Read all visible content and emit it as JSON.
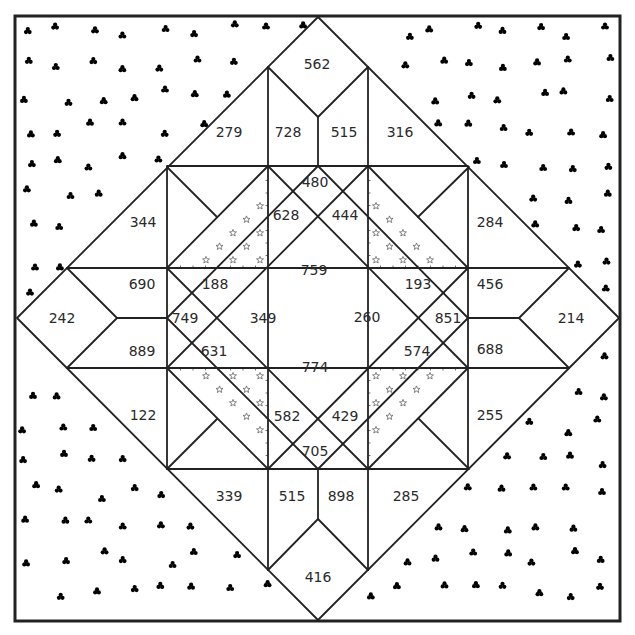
{
  "colors": {
    "line": "#222222",
    "text": "#2a2a2a",
    "clover": "#555555",
    "star": "#666666",
    "background": "#ffffff"
  },
  "patterns": {
    "background_corners": "clover-icon",
    "inner_corner_triangles": "star-icon"
  },
  "patches": {
    "top_apex": "562",
    "top_left_of_v": "728",
    "top_right_of_v": "515",
    "top_left_outer": "279",
    "top_right_outer": "316",
    "upper_left_outer": "344",
    "upper_right_outer": "284",
    "center_top": "480",
    "center_top_left": "628",
    "center_top_right": "444",
    "center_upper": "759",
    "center_left_top": "188",
    "center_right_top": "193",
    "center_left": "749",
    "center_right": "851",
    "center_mid_left": "349",
    "center_mid_right": "260",
    "center_left_bottom": "631",
    "center_right_bottom": "574",
    "center_lower": "774",
    "center_bottom_left": "582",
    "center_bottom_right": "429",
    "center_bottom": "705",
    "left_apex": "242",
    "left_upper_arm": "690",
    "left_lower_arm": "889",
    "right_apex": "214",
    "right_upper_arm": "456",
    "right_lower_arm": "688",
    "lower_left_outer": "122",
    "lower_right_outer": "255",
    "bottom_left_outer": "339",
    "bottom_right_outer": "285",
    "bottom_left_of_v": "515",
    "bottom_right_of_v": "898",
    "bottom_apex": "416"
  }
}
